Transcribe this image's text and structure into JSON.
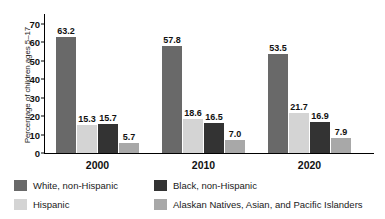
{
  "chart_data": {
    "type": "bar",
    "title": "",
    "subtitle": "",
    "xlabel": "",
    "ylabel": "Percentage of children ages 5–17",
    "ylim": [
      0,
      70
    ],
    "yticks": [
      0,
      10,
      20,
      30,
      40,
      50,
      60,
      70
    ],
    "ytick_labels": [
      "0",
      "10",
      "20",
      "30",
      "40",
      "50",
      "60",
      "70"
    ],
    "grid": false,
    "legend_position": "bottom",
    "categories": [
      "2000",
      "2010",
      "2020"
    ],
    "series": [
      {
        "name": "White, non-Hispanic",
        "color": "#696969",
        "values": [
          63.2,
          57.8,
          53.5
        ],
        "labels": [
          "63.2",
          "57.8",
          "53.5"
        ]
      },
      {
        "name": "Hispanic",
        "color": "#d4d4d4",
        "values": [
          15.3,
          18.6,
          21.7
        ],
        "labels": [
          "15.3",
          "18.6",
          "21.7"
        ]
      },
      {
        "name": "Black, non-Hispanic",
        "color": "#333333",
        "values": [
          15.7,
          16.5,
          16.9
        ],
        "labels": [
          "15.7",
          "16.5",
          "16.9"
        ]
      },
      {
        "name": "Alaskan Natives, Asian, and Pacific Islanders",
        "color": "#a8a8a8",
        "values": [
          5.7,
          7.0,
          7.9
        ],
        "labels": [
          "5.7",
          "7.0",
          "7.9"
        ]
      }
    ],
    "legend": [
      {
        "label": "White, non-Hispanic",
        "color": "#696969"
      },
      {
        "label": "Black, non-Hispanic",
        "color": "#333333"
      },
      {
        "label": "Hispanic",
        "color": "#d4d4d4"
      },
      {
        "label": "Alaskan Natives, Asian, and Pacific Islanders",
        "color": "#a8a8a8"
      }
    ]
  }
}
